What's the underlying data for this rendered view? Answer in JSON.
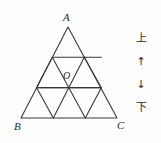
{
  "figure": {
    "type": "geometry-diagram",
    "stroke_color": "#3a3a3a",
    "background_color": "#fefefe",
    "vertices": {
      "apex_label": "A",
      "bottom_left_label": "B",
      "bottom_right_label": "C",
      "interior_point_label": "O"
    },
    "subdivision": {
      "rows": 3,
      "small_triangles_total": 9,
      "upward_triangles": 6,
      "downward_triangles": 3
    },
    "geometry": {
      "apex": [
        68,
        27
      ],
      "bottom_left": [
        21,
        118
      ],
      "bottom_right": [
        117,
        118
      ],
      "interior_point_O": [
        70,
        88
      ],
      "horizontal_line_1_y": 58,
      "horizontal_line_2_y": 88
    }
  },
  "direction_key": {
    "name": "vertical-direction-key",
    "top_label": "上",
    "up_arrow": "↑",
    "down_arrow": "↓",
    "bottom_label": "下"
  }
}
